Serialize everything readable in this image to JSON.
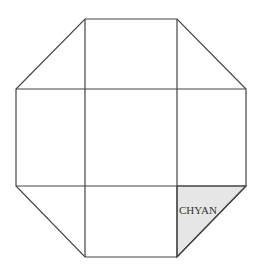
{
  "diagram": {
    "shape": "octagon-grid",
    "grid": {
      "rows": 3,
      "cols": 3
    },
    "colors": {
      "stroke": "#444444",
      "highlight_fill": "#e6e6e6",
      "background": "#ffffff"
    },
    "highlighted_region": {
      "position": "bottom-right-corner",
      "label": "CHYAN"
    }
  }
}
